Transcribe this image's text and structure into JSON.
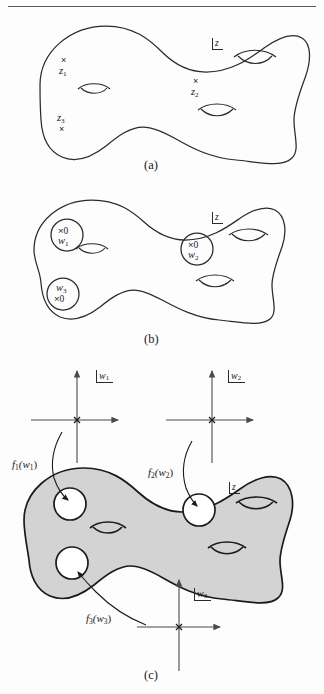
{
  "figure": {
    "kind": "mathematical-illustration",
    "rule_visible": true
  },
  "panels": [
    {
      "id": "a",
      "caption": "(a)",
      "surface_label": "z",
      "marks": [
        {
          "id": "z1",
          "cross": "×",
          "label": "z",
          "subscript": "1",
          "cross_position": "above"
        },
        {
          "id": "z2",
          "cross": "×",
          "label": "z",
          "subscript": "2",
          "cross_position": "above"
        },
        {
          "id": "z3",
          "cross": "×",
          "label": "z",
          "subscript": "3",
          "cross_position": "below"
        }
      ],
      "handle_count": 3
    },
    {
      "id": "b",
      "caption": "(b)",
      "surface_label": "z",
      "disks": [
        {
          "id": "w1",
          "cross": "×",
          "value": "0",
          "label": "w",
          "subscript": "1",
          "label_position": "below"
        },
        {
          "id": "w2",
          "cross": "×",
          "value": "0",
          "label": "w",
          "subscript": "2",
          "label_position": "below"
        },
        {
          "id": "w3",
          "cross": "×",
          "value": "0",
          "label": "w",
          "subscript": "3",
          "label_position": "above"
        }
      ],
      "handle_count": 3
    },
    {
      "id": "c",
      "caption": "(c)",
      "surface_label": "z",
      "surface_fill": "#d3d3d3",
      "charts": [
        {
          "id": "w1",
          "axis_label": "w",
          "axis_subscript": "1",
          "origin_mark": "×",
          "position": "top-left"
        },
        {
          "id": "w2",
          "axis_label": "w",
          "axis_subscript": "2",
          "origin_mark": "×",
          "position": "top-right"
        },
        {
          "id": "w3",
          "axis_label": "w",
          "axis_subscript": "3",
          "origin_mark": "×",
          "position": "bottom-center"
        }
      ],
      "maps": [
        {
          "id": "f1",
          "text": "f",
          "subscript": "1",
          "arg": "(w",
          "arg_subscript": "1",
          "arg_close": ")",
          "full": "f₁(w₁)"
        },
        {
          "id": "f2",
          "text": "f",
          "subscript": "2",
          "arg": "(w",
          "arg_subscript": "2",
          "arg_close": ")",
          "full": "f₂(w₂)"
        },
        {
          "id": "f3",
          "text": "f",
          "subscript": "3",
          "arg": "(w",
          "arg_subscript": "3",
          "arg_close": ")",
          "full": "f₃(w₃)"
        }
      ]
    }
  ],
  "colors": {
    "ink": "#1b1b1b",
    "stroke": "#2a2a2a",
    "surface_fill": "#d3d3d3",
    "axis": "#4a4a4a",
    "page": "#fdfdfd"
  }
}
